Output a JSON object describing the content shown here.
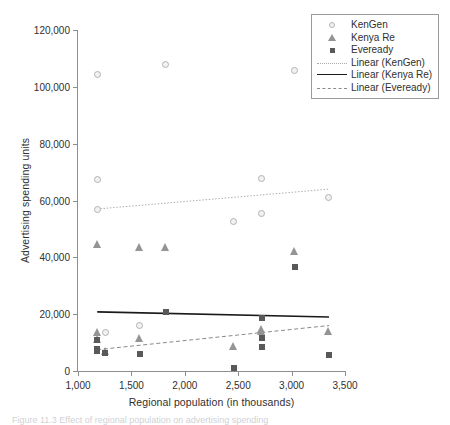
{
  "chart_data": {
    "type": "scatter",
    "title": "",
    "xlabel": "Regional population (in thousands)",
    "ylabel": "Advertising spending units",
    "xlim": [
      1000,
      3500
    ],
    "ylim": [
      0,
      120000
    ],
    "xticks": [
      "1,000",
      "1,500",
      "2,000",
      "2,500",
      "3,000",
      "3,500"
    ],
    "xtick_values": [
      1000,
      1500,
      2000,
      2500,
      3000,
      3500
    ],
    "yticks": [
      "0",
      "20,000",
      "40,000",
      "60,000",
      "80,000",
      "100,000",
      "120,000"
    ],
    "ytick_values": [
      0,
      20000,
      40000,
      60000,
      80000,
      100000,
      120000
    ],
    "grid": false,
    "legend_position": "top-right",
    "series": [
      {
        "name": "KenGen",
        "marker": "open-circle",
        "color": "#b2b2b2",
        "points": [
          [
            1180,
            104500
          ],
          [
            1180,
            67500
          ],
          [
            1180,
            56800
          ],
          [
            1255,
            13500
          ],
          [
            1580,
            16100
          ],
          [
            1820,
            107800
          ],
          [
            2460,
            52700
          ],
          [
            2720,
            67800
          ],
          [
            2720,
            55300
          ],
          [
            3030,
            105700
          ],
          [
            3350,
            61000
          ]
        ]
      },
      {
        "name": "Kenya Re",
        "marker": "triangle",
        "color": "#949494",
        "points": [
          [
            1180,
            44600
          ],
          [
            1180,
            13800
          ],
          [
            1180,
            11200
          ],
          [
            1255,
            6900
          ],
          [
            1580,
            43700
          ],
          [
            1580,
            11700
          ],
          [
            1820,
            43700
          ],
          [
            2460,
            8800
          ],
          [
            2720,
            14900
          ],
          [
            2720,
            14200
          ],
          [
            3030,
            42200
          ],
          [
            3350,
            14100
          ]
        ]
      },
      {
        "name": "Eveready",
        "marker": "filled-square",
        "color": "#595959",
        "points": [
          [
            1180,
            11000
          ],
          [
            1180,
            7900
          ],
          [
            1180,
            7200
          ],
          [
            1255,
            6500
          ],
          [
            1580,
            6000
          ],
          [
            1820,
            20900
          ],
          [
            2460,
            1200
          ],
          [
            2720,
            18500
          ],
          [
            2720,
            11500
          ],
          [
            2720,
            8400
          ],
          [
            3030,
            36500
          ],
          [
            3350,
            5600
          ]
        ]
      }
    ],
    "trendlines": [
      {
        "name": "Linear (KenGen)",
        "style": "dotted",
        "color": "#aaaaaa",
        "x_start": 1180,
        "y_start": 57000,
        "x_end": 3350,
        "y_end": 64000
      },
      {
        "name": "Linear (Kenya Re)",
        "style": "solid",
        "color": "#1a1a1a",
        "x_start": 1180,
        "y_start": 20800,
        "x_end": 3350,
        "y_end": 19000
      },
      {
        "name": "Linear (Eveready)",
        "style": "dashed",
        "color": "#8a8a8a",
        "x_start": 1180,
        "y_start": 7500,
        "x_end": 3350,
        "y_end": 16000
      }
    ],
    "legend_entries": [
      {
        "label": "KenGen",
        "key": "open-circle"
      },
      {
        "label": "Kenya Re",
        "key": "triangle"
      },
      {
        "label": "Eveready",
        "key": "filled-square"
      },
      {
        "label": "Linear (KenGen)",
        "key": "dotted-line"
      },
      {
        "label": "Linear (Kenya Re)",
        "key": "solid-line"
      },
      {
        "label": "Linear (Eveready)",
        "key": "dashed-line"
      }
    ]
  },
  "caption": {
    "text": "Figure 11.3 Effect of regional population on advertising spending"
  }
}
